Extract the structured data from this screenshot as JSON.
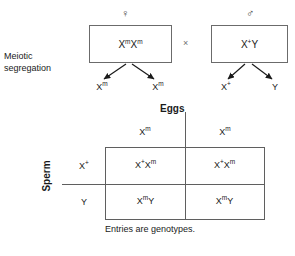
{
  "diagram": {
    "side_label": "Meiotic segregation",
    "caption": "Entries are genotypes."
  },
  "cross": {
    "operator": "×",
    "female": {
      "symbol": "♀",
      "symbol_name": "female-symbol",
      "genotype_html": "X<sup>m</sup>X<sup>m</sup>",
      "gametes": [
        {
          "label_html": "X<sup>m</sup>"
        },
        {
          "label_html": "X<sup>m</sup>"
        }
      ]
    },
    "male": {
      "symbol": "♂",
      "symbol_name": "male-symbol",
      "genotype_html": "X<sup>+</sup>Y",
      "gametes": [
        {
          "label_html": "X<sup>+</sup>"
        },
        {
          "label_html": "Y"
        }
      ]
    }
  },
  "punnett": {
    "column_axis_label": "Eggs",
    "row_axis_label": "Sperm",
    "column_headers": [
      {
        "label_html": "X<sup>m</sup>"
      },
      {
        "label_html": "X<sup>m</sup>"
      }
    ],
    "row_headers": [
      {
        "label_html": "X<sup>+</sup>"
      },
      {
        "label_html": "Y"
      }
    ],
    "cells": [
      {
        "label_html": "X<sup>+</sup>X<sup>m</sup>"
      },
      {
        "label_html": "X<sup>+</sup>X<sup>m</sup>"
      },
      {
        "label_html": "X<sup>m</sup>Y"
      },
      {
        "label_html": "X<sup>m</sup>Y"
      }
    ]
  },
  "colors": {
    "line": "#5f6b6b",
    "box_border": "#6b6b6b",
    "text": "#1a1a1a",
    "background": "#ffffff"
  }
}
